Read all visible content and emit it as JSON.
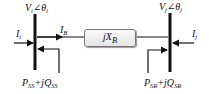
{
  "diagram": {
    "bus_i": {
      "voltage": "V",
      "voltage_sub": "i",
      "angle_symbol": "∠θ",
      "angle_sub": "i"
    },
    "bus_j": {
      "voltage": "V",
      "voltage_sub": "j",
      "angle_symbol": "∠θ",
      "angle_sub": "j"
    },
    "current_i": {
      "symbol": "I",
      "sub": "i"
    },
    "current_j": {
      "symbol": "I",
      "sub": "j"
    },
    "current_branch": {
      "symbol": "I",
      "sub": "B"
    },
    "reactance": {
      "prefix": "jX",
      "sub": "B"
    },
    "power_sending": {
      "p": "P",
      "p_sub": "SS",
      "plus_jq": "+jQ",
      "q_sub": "SS"
    },
    "power_receiving": {
      "p": "P",
      "p_sub": "SR",
      "plus_jq": "+jQ",
      "q_sub": "SR"
    },
    "colors": {
      "line": "#111111",
      "box_border": "#777777"
    }
  }
}
